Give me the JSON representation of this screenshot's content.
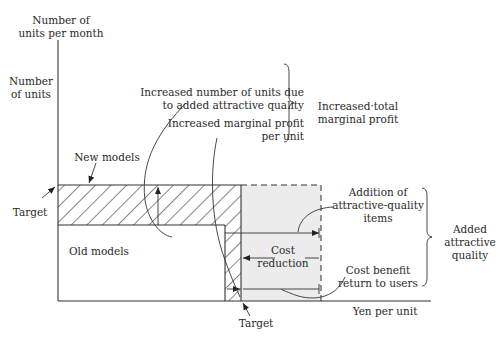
{
  "axes": {
    "y_label_line1": "Number of",
    "y_label_line2": "units per month",
    "y_sub_label_line1": "Number",
    "y_sub_label_line2": "of units",
    "x_label": "Yen per unit"
  },
  "regions": {
    "new_models": "New models",
    "old_models": "Old models",
    "cost_reduction_line1": "Cost",
    "cost_reduction_line2": "reduction"
  },
  "markers": {
    "target_y": "Target",
    "target_x": "Target"
  },
  "annotations": {
    "increased_units_line1": "Increased number of units due",
    "increased_units_line2": "to added attractive quality",
    "increased_margin_line1": "Increased marginal profit",
    "increased_margin_line2": "per unit",
    "increased_total_line1": "Increased·total",
    "increased_total_line2": "marginal profit",
    "addition_line1": "Addition of",
    "addition_line2": "attractive-quality",
    "addition_line3": "items",
    "cost_benefit_line1": "Cost benefit",
    "cost_benefit_line2": "return to users",
    "added_quality_line1": "Added",
    "added_quality_line2": "attractive",
    "added_quality_line3": "quality"
  },
  "colors": {
    "line": "#333333",
    "shaded_area": "#ececec",
    "background": "#ffffff"
  }
}
